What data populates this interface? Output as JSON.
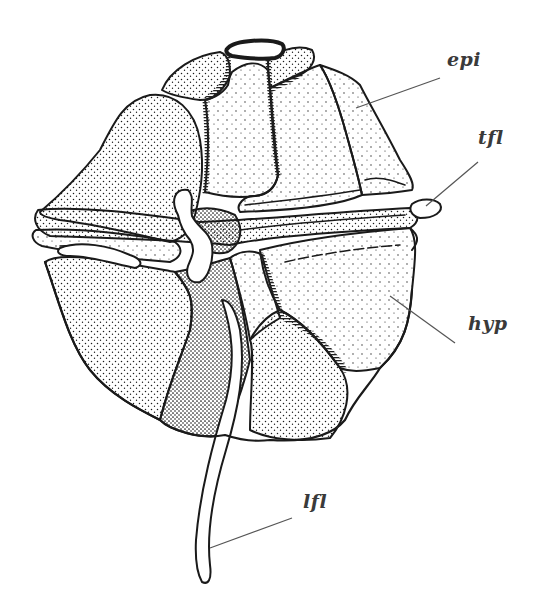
{
  "figure": {
    "style": "stippled pen-and-ink drawing",
    "colors": {
      "ink": "#1a1a1a",
      "background": "#ffffff",
      "leader": "#555555"
    }
  },
  "labels": [
    {
      "id": "epi",
      "text": "epi",
      "meaning": "epicone",
      "x": 447,
      "y": 64
    },
    {
      "id": "tfl",
      "text": "tfl",
      "meaning": "transverse flagellum",
      "x": 478,
      "y": 142
    },
    {
      "id": "hyp",
      "text": "hyp",
      "meaning": "hypocone",
      "x": 468,
      "y": 328
    },
    {
      "id": "lfl",
      "text": "lfl",
      "meaning": "longitudinal flagellum",
      "x": 303,
      "y": 506
    }
  ]
}
